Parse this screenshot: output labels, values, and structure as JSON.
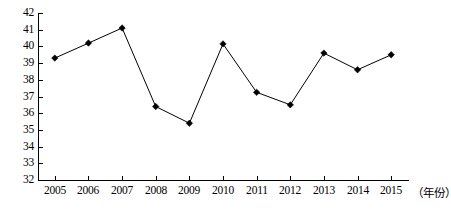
{
  "chart_data": {
    "type": "line",
    "title": "",
    "subtitle": "",
    "xlabel": "（年份）",
    "ylabel": "",
    "categories": [
      "2005",
      "2006",
      "2007",
      "2008",
      "2009",
      "2010",
      "2011",
      "2012",
      "2013",
      "2014",
      "2015"
    ],
    "values": [
      39.3,
      40.2,
      41.1,
      36.4,
      35.4,
      40.15,
      37.25,
      36.5,
      39.6,
      38.6,
      39.5
    ],
    "series": [
      {
        "name": "",
        "values": [
          39.3,
          40.2,
          41.1,
          36.4,
          35.4,
          40.15,
          37.25,
          36.5,
          39.6,
          38.6,
          39.5
        ]
      }
    ],
    "ylim": [
      32,
      42
    ],
    "ytick_step": 1,
    "ytick_labels": [
      "42",
      "41",
      "40",
      "39",
      "38",
      "37",
      "36",
      "35",
      "34",
      "33",
      "32"
    ],
    "xtick_labels": [
      "2005",
      "2006",
      "2007",
      "2008",
      "2009",
      "2010",
      "2011",
      "2012",
      "2013",
      "2014",
      "2015"
    ],
    "grid": false,
    "legend": "none",
    "marker": "diamond",
    "line_color": "#000000",
    "marker_color": "#000000",
    "background_color": "#ffffff"
  },
  "caption": {
    "text": ""
  }
}
